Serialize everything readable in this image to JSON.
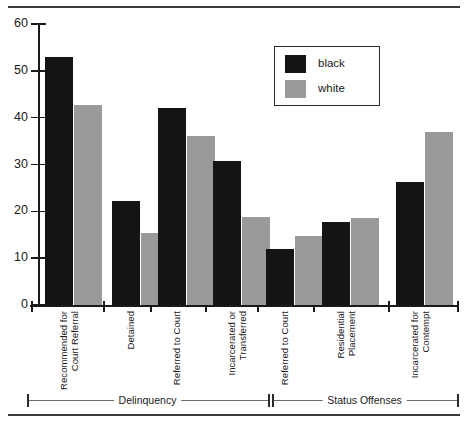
{
  "chart_data": {
    "type": "bar",
    "title": "",
    "xlabel": "",
    "ylabel": "",
    "ylim": [
      0,
      60
    ],
    "yticks": [
      0,
      10,
      20,
      30,
      40,
      50,
      60
    ],
    "grid": false,
    "legend_position": "top-right",
    "categories": [
      "Recommended for Court Referral",
      "Detained",
      "Referred to Court",
      "Incarcerated or Transferred",
      "Referred to Court",
      "Residential Placement",
      "Incarcerated for Contempt"
    ],
    "category_lines": [
      [
        "Recommended for",
        "Court Referral"
      ],
      [
        "Detained"
      ],
      [
        "Referred to Court"
      ],
      [
        "Incarcerated or",
        "Transferred"
      ],
      [
        "Referred to Court"
      ],
      [
        "Residential",
        "Placement"
      ],
      [
        "Incarcerated for",
        "Contempt"
      ]
    ],
    "series": [
      {
        "name": "black",
        "color": "#141414",
        "values": [
          53,
          22.2,
          42.1,
          30.7,
          12,
          17.8,
          26.3
        ]
      },
      {
        "name": "white",
        "color": "#9a9a9a",
        "values": [
          42.7,
          15.3,
          36,
          18.9,
          14.7,
          18.6,
          36.9
        ]
      }
    ],
    "groups": [
      {
        "label": "Delinquency",
        "categories": [
          0,
          1,
          2,
          3
        ]
      },
      {
        "label": "Status Offenses",
        "categories": [
          4,
          5,
          6
        ]
      }
    ]
  },
  "legend": {
    "entries": [
      {
        "label": "black"
      },
      {
        "label": "white"
      }
    ]
  },
  "axis": {
    "y_tick_labels": [
      "60",
      "50",
      "40",
      "30",
      "20",
      "10",
      "0"
    ]
  }
}
